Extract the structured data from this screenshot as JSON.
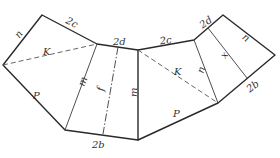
{
  "diagram": {
    "type": "geometric-net",
    "labels": {
      "n_left": "n",
      "two_c_left": "2c",
      "K_left": "K",
      "P_left": "P",
      "two_d_mid": "2d",
      "m_left": "m",
      "f_mid": "f",
      "m_right": "m",
      "two_b_mid": "2b",
      "two_c_right": "2c",
      "K_right": "K",
      "n_inner_right": "n",
      "P_right": "P",
      "two_d_right": "2d",
      "x_right": "x",
      "n_outer_right": "n",
      "two_b_right": "2b"
    },
    "colors": {
      "line": "#2a2a2a",
      "text": "#333333",
      "background": "#ffffff"
    }
  }
}
